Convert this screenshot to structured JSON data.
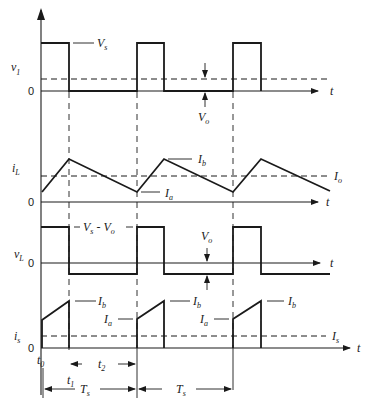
{
  "diagram": {
    "panels": [
      {
        "id": "v1",
        "ylabel": "v",
        "ylabel_sub": "1",
        "zero": "0",
        "time_label": "t",
        "annotations": [
          {
            "text": "V",
            "sub": "s"
          },
          {
            "text": "V",
            "sub": "o"
          }
        ]
      },
      {
        "id": "iL",
        "ylabel": "i",
        "ylabel_sub": "L",
        "zero": "0",
        "time_label": "t",
        "annotations": [
          {
            "text": "I",
            "sub": "b"
          },
          {
            "text": "I",
            "sub": "a"
          },
          {
            "text": "I",
            "sub": "o"
          }
        ]
      },
      {
        "id": "vL",
        "ylabel": "v",
        "ylabel_sub": "L",
        "zero": "0",
        "time_label": "t",
        "annotations": [
          {
            "text": "V",
            "sub": "s",
            "suffix": " - V",
            "suffix_sub": "o"
          },
          {
            "text": "V",
            "sub": "o"
          }
        ]
      },
      {
        "id": "is",
        "ylabel": "i",
        "ylabel_sub": "s",
        "zero": "0",
        "time_label": "t",
        "annotations": [
          {
            "text": "I",
            "sub": "b"
          },
          {
            "text": "I",
            "sub": "b"
          },
          {
            "text": "I",
            "sub": "b"
          },
          {
            "text": "I",
            "sub": "a"
          },
          {
            "text": "I",
            "sub": "a"
          },
          {
            "text": "I",
            "sub": "s"
          }
        ]
      }
    ],
    "timing": {
      "t0": {
        "text": "t",
        "sub": "0"
      },
      "t1": {
        "text": "t",
        "sub": "1"
      },
      "t2": {
        "text": "t",
        "sub": "2"
      },
      "Ts": {
        "text": "T",
        "sub": "s"
      }
    }
  },
  "labels": {
    "v": "v",
    "i": "i",
    "V": "V",
    "I": "I",
    "T": "T",
    "t": "t",
    "zero": "0",
    "s": "s",
    "o": "o",
    "a": "a",
    "b": "b",
    "L": "L",
    "one": "1",
    "two": "2",
    "t0sub": "0",
    "minus": " - "
  }
}
